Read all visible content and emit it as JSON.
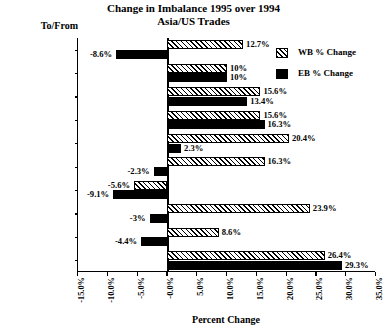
{
  "chart_data": {
    "type": "bar",
    "orientation": "horizontal",
    "title": "Change in Imbalance 1995 over 1994",
    "subtitle": "Asia/US Trades",
    "xlabel": "Percent Change",
    "ylabel": "To/From",
    "xlim": [
      -15.0,
      35.0
    ],
    "xtick_step": 5.0,
    "grid": false,
    "legend_position": "top-right",
    "xticklabels": [
      "-15.0%",
      "-10.0%",
      "-5.0%",
      "-0.0%",
      "5.0%",
      "10.0%",
      "15.0%",
      "20.0%",
      "25.0%",
      "30.0%",
      "35.0%"
    ],
    "xtickvalues": [
      -15,
      -10,
      -5,
      0,
      5,
      10,
      15,
      20,
      25,
      30,
      35
    ],
    "categories": [
      "Singapore",
      "Philippines",
      "Indonesia",
      "Malaysia",
      "Thailand",
      "Korea",
      "Chinese Taipei",
      "Hong Kong",
      "Japan",
      "China"
    ],
    "series": [
      {
        "name": "WB % Change",
        "fill": "hatched",
        "values": [
          12.7,
          10,
          15.6,
          15.6,
          20.4,
          16.3,
          -5.6,
          23.9,
          8.6,
          26.4
        ],
        "labels": [
          "12.7%",
          "10%",
          "15.6%",
          "15.6%",
          "20.4%",
          "16.3%",
          "-5.6%",
          "23.9%",
          "8.6%",
          "26.4%"
        ]
      },
      {
        "name": "EB % Change",
        "fill": "solid-black",
        "values": [
          -8.6,
          10,
          13.4,
          16.3,
          2.3,
          -2.3,
          -9.1,
          -3,
          -4.4,
          29.3
        ],
        "labels": [
          "-8.6%",
          "10%",
          "13.4%",
          "16.3%",
          "2.3%",
          "-2.3%",
          "-9.1%",
          "-3%",
          "-4.4%",
          "29.3%"
        ]
      }
    ]
  },
  "legend": {
    "items": [
      {
        "label": "WB % Change",
        "swatch": "hatched-swatch"
      },
      {
        "label": "EB % Change",
        "swatch": "solid-black-swatch"
      }
    ]
  },
  "colors": {
    "ink": "#000000",
    "paper": "#ffffff"
  }
}
